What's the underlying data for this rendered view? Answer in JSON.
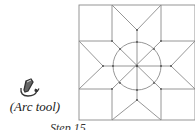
{
  "tool": {
    "icon": "arc-tool-icon",
    "label": "(Arc tool)"
  },
  "caption": "Step 15",
  "diagram": {
    "stroke_color": "#8a8a8a",
    "dot_color": "#555555",
    "square": {
      "x1": 79,
      "y1": 5,
      "x2": 195,
      "y2": 120
    },
    "grid_x": [
      112,
      161
    ],
    "grid_y": [
      41,
      89
    ],
    "center": {
      "x": 137,
      "y": 66
    },
    "circle_radius": 24,
    "star_tips": {
      "top": [
        137,
        30
      ],
      "bottom": [
        137,
        100
      ],
      "left": [
        103,
        66
      ],
      "right": [
        171,
        66
      ]
    }
  }
}
